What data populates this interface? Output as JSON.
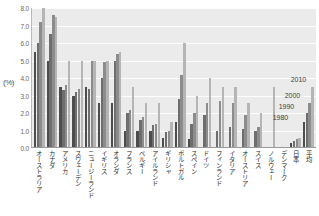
{
  "chart_data": {
    "type": "bar",
    "title": "",
    "xlabel": "",
    "ylabel": "(%)",
    "ylim": [
      0.0,
      8.0
    ],
    "grid": true,
    "legend_position": "inside-right",
    "y_ticks": [
      "0.0",
      "1.0",
      "2.0",
      "3.0",
      "4.0",
      "5.0",
      "6.0",
      "7.0",
      "8.0"
    ],
    "categories": [
      "オーストラリア",
      "カナダ",
      "アメリカ",
      "スウェーデン",
      "ニュージーランド",
      "イギリス",
      "オランダ",
      "フランス",
      "ベルギー",
      "アイルランド",
      "ギリシャ",
      "ポルトガル",
      "スペイン",
      "ドイツ",
      "フィンランド",
      "イタリア",
      "オーストリア",
      "スイス",
      "ノルウェー",
      "デンマーク",
      "日本",
      "平均"
    ],
    "series": [
      {
        "name": "1980",
        "color": "#4d4d4d",
        "values": [
          5.5,
          5.0,
          3.5,
          3.0,
          3.5,
          2.6,
          2.6,
          1.0,
          1.0,
          1.0,
          0.6,
          1.5,
          0.5,
          0.0,
          0.0,
          0.0,
          0.0,
          0.0,
          0.0,
          0.0,
          0.3,
          1.5
        ]
      },
      {
        "name": "1990",
        "color": "#6e6e6e",
        "values": [
          6.0,
          6.5,
          3.3,
          3.2,
          3.4,
          4.0,
          5.0,
          2.0,
          1.6,
          1.3,
          0.9,
          2.8,
          1.4,
          1.9,
          1.0,
          1.2,
          1.1,
          1.0,
          0.0,
          0.0,
          0.4,
          2.0
        ]
      },
      {
        "name": "2000",
        "color": "#8c8c8c",
        "values": [
          7.2,
          7.6,
          3.6,
          3.4,
          5.0,
          4.9,
          5.4,
          2.2,
          1.8,
          1.4,
          1.0,
          4.2,
          2.0,
          2.6,
          2.7,
          2.6,
          1.9,
          1.2,
          0.0,
          0.0,
          0.5,
          2.6
        ]
      },
      {
        "name": "2010",
        "color": "#b5b5b5",
        "values": [
          8.0,
          7.5,
          5.0,
          5.0,
          5.0,
          5.0,
          5.5,
          3.5,
          2.6,
          2.6,
          1.5,
          6.0,
          3.0,
          4.0,
          3.5,
          3.5,
          2.6,
          2.0,
          3.5,
          0.0,
          0.6,
          3.5
        ]
      }
    ],
    "legend_entries": [
      "2010",
      "2000",
      "1990",
      "1980"
    ]
  },
  "colors": {
    "plot_background": "#ebebeb",
    "gridline": "#fdfdfd",
    "axis": "#9a9a9a",
    "tick_text": "#666666",
    "label_text": "#2b2b2b"
  }
}
